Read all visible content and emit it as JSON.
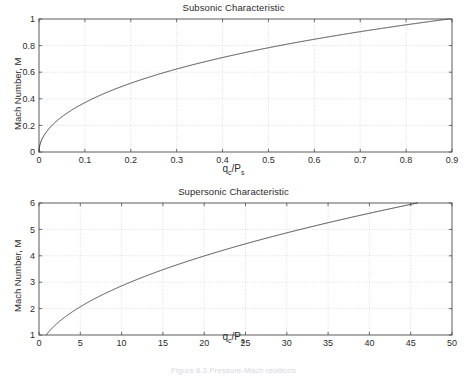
{
  "figure": {
    "caption": "Figure 8.3  Pressure-Mach relations",
    "background_color": "#ffffff",
    "curve_color": "#3a3a3a",
    "axis_color": "#4a4a4a",
    "grid_color": "#c8c8c8"
  },
  "chart_data": [
    {
      "type": "line",
      "id": "subsonic",
      "title": "Subsonic Characteristic",
      "xlabel_text": "q",
      "xlabel_sub1": "c",
      "xlabel_mid": "/P",
      "xlabel_sub2": "s",
      "xlabel": "qc/Ps",
      "ylabel": "Mach Number, M",
      "xlim": [
        0,
        0.9
      ],
      "ylim": [
        0,
        1
      ],
      "grid": true,
      "legend": "none",
      "xticks": [
        0,
        0.1,
        0.2,
        0.3,
        0.4,
        0.5,
        0.6,
        0.7,
        0.8,
        0.9
      ],
      "xticklabels": [
        "0",
        "0.1",
        "0.2",
        "0.3",
        "0.4",
        "0.5",
        "0.6",
        "0.7",
        "0.8",
        "0.9"
      ],
      "yticks": [
        0,
        0.2,
        0.4,
        0.6,
        0.8,
        1
      ],
      "yticklabels": [
        "0",
        "0.2",
        "0.4",
        "0.6",
        "0.8",
        "1"
      ],
      "equation": "subsonic_isentropic",
      "x": [
        0,
        0.005,
        0.01,
        0.02,
        0.03,
        0.04,
        0.05,
        0.06,
        0.08,
        0.1,
        0.12,
        0.15,
        0.18,
        0.2,
        0.25,
        0.3,
        0.35,
        0.4,
        0.45,
        0.5,
        0.55,
        0.6,
        0.65,
        0.7,
        0.75,
        0.8,
        0.85,
        0.8929
      ],
      "y": [
        0,
        0.0598,
        0.0845,
        0.1194,
        0.1461,
        0.1686,
        0.1883,
        0.2061,
        0.2374,
        0.2646,
        0.2888,
        0.3208,
        0.3491,
        0.3666,
        0.4062,
        0.4418,
        0.4744,
        0.5047,
        0.533,
        0.5598,
        0.5852,
        0.6095,
        0.6328,
        0.6552,
        0.6768,
        0.6977,
        0.718,
        0.7355
      ]
    },
    {
      "type": "line",
      "id": "supersonic",
      "title": "Supersonic Characteristic",
      "xlabel_text": "q",
      "xlabel_sub1": "c",
      "xlabel_mid": "/P",
      "xlabel_sub2": "s",
      "xlabel": "qc/Ps",
      "ylabel": "Mach Number, M",
      "xlim": [
        0,
        50
      ],
      "ylim": [
        1,
        6
      ],
      "grid": true,
      "legend": "none",
      "xticks": [
        0,
        5,
        10,
        15,
        20,
        25,
        30,
        35,
        40,
        45,
        50
      ],
      "xticklabels": [
        "0",
        "5",
        "10",
        "15",
        "20",
        "25",
        "30",
        "35",
        "40",
        "45",
        "50"
      ],
      "yticks": [
        1,
        2,
        3,
        4,
        5,
        6
      ],
      "yticklabels": [
        "1",
        "2",
        "3",
        "4",
        "5",
        "6"
      ],
      "equation": "rayleigh_pitot",
      "x": [
        0.8929,
        1.5,
        2.0,
        2.5,
        3.0,
        4.0,
        5.0,
        6.5,
        8.0,
        10.0,
        12.0,
        14.0,
        16.0,
        18.0,
        20.0,
        23.0,
        26.0,
        29.0,
        32.0,
        35.0,
        38.0,
        41.0,
        45.4
      ],
      "y": [
        1.0,
        1.18,
        1.29,
        1.39,
        1.48,
        1.63,
        1.76,
        1.94,
        2.09,
        2.28,
        2.45,
        2.61,
        2.75,
        2.89,
        3.02,
        3.2,
        3.37,
        3.53,
        3.68,
        3.83,
        3.97,
        4.1,
        4.28
      ]
    }
  ]
}
